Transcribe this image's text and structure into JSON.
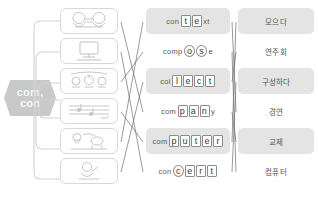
{
  "worksheet": {
    "prefix_badge": {
      "line1": "com,",
      "line2": "con",
      "color": "#c9c9c9"
    },
    "columns": {
      "pictures_label": "picture-cards",
      "words_label": "english-words",
      "meanings_label": "korean-meanings"
    },
    "rows": [
      {
        "picture": "two-people-talking-icon",
        "word": {
          "prefix": "con",
          "highlight": "t e",
          "suffix": "xt",
          "full": "context",
          "boxed_letters": [
            "t",
            "e"
          ],
          "shape": "square"
        },
        "meaning": "모으다",
        "shaded": true
      },
      {
        "picture": "computer-monitor-icon",
        "word": {
          "prefix": "comp",
          "highlight": "o s",
          "suffix": "e",
          "full": "compose",
          "boxed_letters": [
            "o",
            "s"
          ],
          "shape": "round"
        },
        "meaning": "연주회",
        "shaded": false
      },
      {
        "picture": "orchestra-concert-icon",
        "word": {
          "prefix": "col",
          "highlight": "l e c t",
          "suffix": "",
          "full": "collect",
          "boxed_letters": [
            "l",
            "e",
            "c",
            "t"
          ],
          "shape": "square"
        },
        "meaning": "구성하다",
        "shaded": true
      },
      {
        "picture": "music-score-icon",
        "word": {
          "prefix": "com",
          "highlight": "p a n",
          "suffix": "y",
          "full": "company",
          "boxed_letters": [
            "p",
            "a",
            "n"
          ],
          "shape": "square"
        },
        "meaning": "경연",
        "shaded": false
      },
      {
        "picture": "animals-gathering-icon",
        "word": {
          "prefix": "com",
          "highlight": "p u t e r",
          "suffix": "",
          "full": "computer",
          "boxed_letters": [
            "p",
            "u",
            "t",
            "e",
            "r"
          ],
          "shape": "square"
        },
        "meaning": "교제",
        "shaded": true
      },
      {
        "picture": "person-writing-icon",
        "word": {
          "prefix": "con",
          "highlight": "c e r t",
          "suffix": "",
          "full": "concert",
          "boxed_letters": [
            "c",
            "e",
            "r",
            "t"
          ],
          "shape": "round"
        },
        "meaning": "컴퓨터",
        "shaded": false
      }
    ],
    "colors": {
      "row_shade": "#e4e4e4",
      "line": "#6f6f6f",
      "card_border": "#d8d8d8",
      "text": "#4a4a4a",
      "background": "#ffffff"
    }
  }
}
